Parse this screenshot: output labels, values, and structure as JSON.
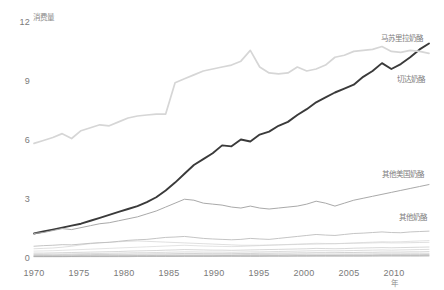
{
  "chart_data": {
    "type": "line",
    "title": "",
    "xlabel": "年",
    "ylabel": "消费量",
    "xlim": [
      1970,
      2012
    ],
    "ylim": [
      0,
      12
    ],
    "grid": false,
    "legend_position": "right-inline-labels",
    "xticks": [
      "1970",
      "1975",
      "1980",
      "1985",
      "1990",
      "1995",
      "2000",
      "2005",
      "2010"
    ],
    "xtick_values": [
      1970,
      1975,
      1980,
      1985,
      1990,
      1995,
      2000,
      2005,
      2010
    ],
    "yticks": [
      "0",
      "3",
      "6",
      "9",
      "12"
    ],
    "ytick_values": [
      0,
      3,
      6,
      9,
      12
    ],
    "x": [
      1970,
      1971,
      1972,
      1973,
      1974,
      1975,
      1976,
      1977,
      1978,
      1979,
      1980,
      1981,
      1982,
      1983,
      1984,
      1985,
      1986,
      1987,
      1988,
      1989,
      1990,
      1991,
      1992,
      1993,
      1994,
      1995,
      1996,
      1997,
      1998,
      1999,
      2000,
      2001,
      2002,
      2003,
      2004,
      2005,
      2006,
      2007,
      2008,
      2009,
      2010,
      2011,
      2012
    ],
    "series": [
      {
        "name": "马苏里拉奶酪",
        "color": "#3a3a3a",
        "width": 1.9,
        "values": [
          1.2,
          1.3,
          1.4,
          1.5,
          1.6,
          1.7,
          1.85,
          2.0,
          2.15,
          2.3,
          2.45,
          2.6,
          2.8,
          3.05,
          3.4,
          3.8,
          4.25,
          4.7,
          5.0,
          5.3,
          5.7,
          5.65,
          6.0,
          5.9,
          6.25,
          6.4,
          6.7,
          6.9,
          7.25,
          7.55,
          7.9,
          8.15,
          8.4,
          8.6,
          8.8,
          9.2,
          9.5,
          9.9,
          9.6,
          9.85,
          10.2,
          10.6,
          10.9
        ]
      },
      {
        "name": "切达奶酪",
        "color": "#d6d6d6",
        "width": 1.7,
        "values": [
          5.8,
          5.95,
          6.1,
          6.3,
          6.05,
          6.45,
          6.6,
          6.75,
          6.7,
          6.9,
          7.1,
          7.2,
          7.25,
          7.3,
          7.3,
          8.9,
          9.1,
          9.3,
          9.5,
          9.6,
          9.7,
          9.8,
          10.0,
          10.55,
          9.7,
          9.4,
          9.35,
          9.4,
          9.7,
          9.5,
          9.6,
          9.8,
          10.2,
          10.3,
          10.5,
          10.55,
          10.6,
          10.75,
          10.5,
          10.45,
          10.55,
          10.5,
          10.4
        ]
      },
      {
        "name": "其他美国奶酪",
        "color": "#a9a9a9",
        "width": 1.0,
        "values": [
          1.2,
          1.25,
          1.35,
          1.45,
          1.4,
          1.5,
          1.6,
          1.7,
          1.75,
          1.85,
          1.95,
          2.05,
          2.2,
          2.35,
          2.55,
          2.75,
          2.95,
          2.9,
          2.75,
          2.7,
          2.65,
          2.55,
          2.5,
          2.6,
          2.5,
          2.45,
          2.5,
          2.55,
          2.6,
          2.7,
          2.85,
          2.75,
          2.6,
          2.75,
          2.9,
          3.0,
          3.1,
          3.2,
          3.3,
          3.4,
          3.5,
          3.6,
          3.7
        ]
      },
      {
        "name": "其他奶酪",
        "color": "#bdbdbd",
        "width": 0.9,
        "values": [
          0.55,
          0.58,
          0.6,
          0.63,
          0.62,
          0.66,
          0.7,
          0.73,
          0.75,
          0.8,
          0.85,
          0.88,
          0.9,
          0.95,
          1.0,
          1.02,
          1.05,
          1.0,
          0.95,
          0.92,
          0.9,
          0.88,
          0.9,
          0.95,
          0.92,
          0.9,
          0.95,
          1.0,
          1.05,
          1.1,
          1.15,
          1.12,
          1.1,
          1.15,
          1.2,
          1.22,
          1.25,
          1.28,
          1.25,
          1.24,
          1.28,
          1.3,
          1.32
        ]
      }
    ],
    "background_series": [
      {
        "name": "thin-1",
        "color": "#c9c9c9",
        "width": 0.6,
        "values": [
          0.42,
          0.44,
          0.46,
          0.5,
          0.55,
          0.62,
          0.68,
          0.72,
          0.75,
          0.78,
          0.8,
          0.82,
          0.8,
          0.78,
          0.76,
          0.74,
          0.72,
          0.7,
          0.68,
          0.66,
          0.64,
          0.62,
          0.6,
          0.6,
          0.6,
          0.61,
          0.62,
          0.63,
          0.64,
          0.65,
          0.66,
          0.67,
          0.68,
          0.69,
          0.7,
          0.71,
          0.72,
          0.73,
          0.72,
          0.72,
          0.73,
          0.74,
          0.75
        ]
      },
      {
        "name": "thin-2",
        "color": "#d0d0d0",
        "width": 0.6,
        "values": [
          0.3,
          0.31,
          0.32,
          0.34,
          0.36,
          0.38,
          0.4,
          0.42,
          0.44,
          0.46,
          0.48,
          0.5,
          0.52,
          0.54,
          0.56,
          0.58,
          0.6,
          0.58,
          0.56,
          0.55,
          0.54,
          0.53,
          0.54,
          0.56,
          0.58,
          0.6,
          0.62,
          0.64,
          0.66,
          0.68,
          0.7,
          0.69,
          0.68,
          0.7,
          0.72,
          0.74,
          0.76,
          0.78,
          0.77,
          0.78,
          0.8,
          0.82,
          0.84
        ]
      },
      {
        "name": "thin-3",
        "color": "#bcbcbc",
        "width": 0.6,
        "values": [
          0.2,
          0.2,
          0.21,
          0.22,
          0.23,
          0.24,
          0.25,
          0.26,
          0.27,
          0.28,
          0.3,
          0.31,
          0.32,
          0.33,
          0.35,
          0.36,
          0.38,
          0.37,
          0.36,
          0.35,
          0.35,
          0.34,
          0.35,
          0.36,
          0.37,
          0.38,
          0.39,
          0.4,
          0.41,
          0.42,
          0.44,
          0.43,
          0.42,
          0.43,
          0.45,
          0.46,
          0.47,
          0.48,
          0.47,
          0.48,
          0.49,
          0.5,
          0.51
        ]
      },
      {
        "name": "thin-4",
        "color": "#c4c4c4",
        "width": 0.6,
        "values": [
          0.14,
          0.14,
          0.15,
          0.15,
          0.16,
          0.17,
          0.18,
          0.18,
          0.19,
          0.2,
          0.21,
          0.22,
          0.22,
          0.23,
          0.24,
          0.25,
          0.26,
          0.26,
          0.25,
          0.25,
          0.25,
          0.24,
          0.25,
          0.26,
          0.26,
          0.27,
          0.28,
          0.29,
          0.3,
          0.31,
          0.32,
          0.32,
          0.31,
          0.32,
          0.33,
          0.34,
          0.35,
          0.36,
          0.35,
          0.36,
          0.37,
          0.38,
          0.39
        ]
      },
      {
        "name": "thin-5",
        "color": "#b5b5b5",
        "width": 0.6,
        "values": [
          0.1,
          0.1,
          0.1,
          0.11,
          0.11,
          0.12,
          0.12,
          0.13,
          0.13,
          0.14,
          0.14,
          0.15,
          0.15,
          0.16,
          0.16,
          0.17,
          0.18,
          0.18,
          0.17,
          0.17,
          0.17,
          0.17,
          0.18,
          0.18,
          0.19,
          0.19,
          0.2,
          0.2,
          0.21,
          0.21,
          0.22,
          0.22,
          0.22,
          0.23,
          0.23,
          0.24,
          0.24,
          0.25,
          0.25,
          0.25,
          0.26,
          0.26,
          0.27
        ]
      },
      {
        "name": "thin-6",
        "color": "#cccccc",
        "width": 0.6,
        "values": [
          0.07,
          0.07,
          0.07,
          0.08,
          0.08,
          0.08,
          0.09,
          0.09,
          0.09,
          0.1,
          0.1,
          0.1,
          0.11,
          0.11,
          0.11,
          0.12,
          0.12,
          0.12,
          0.12,
          0.12,
          0.12,
          0.12,
          0.12,
          0.13,
          0.13,
          0.13,
          0.14,
          0.14,
          0.14,
          0.15,
          0.15,
          0.15,
          0.15,
          0.16,
          0.16,
          0.16,
          0.17,
          0.17,
          0.17,
          0.17,
          0.18,
          0.18,
          0.18
        ]
      },
      {
        "name": "thin-7",
        "color": "#b0b0b0",
        "width": 0.6,
        "values": [
          0.05,
          0.05,
          0.05,
          0.05,
          0.05,
          0.06,
          0.06,
          0.06,
          0.06,
          0.07,
          0.07,
          0.07,
          0.07,
          0.08,
          0.08,
          0.08,
          0.08,
          0.08,
          0.08,
          0.08,
          0.08,
          0.08,
          0.09,
          0.09,
          0.09,
          0.09,
          0.09,
          0.1,
          0.1,
          0.1,
          0.1,
          0.1,
          0.1,
          0.11,
          0.11,
          0.11,
          0.11,
          0.12,
          0.12,
          0.12,
          0.12,
          0.12,
          0.13
        ]
      },
      {
        "name": "thin-8",
        "color": "#a8a8a8",
        "width": 0.6,
        "values": [
          0.03,
          0.03,
          0.03,
          0.03,
          0.03,
          0.04,
          0.04,
          0.04,
          0.04,
          0.04,
          0.04,
          0.05,
          0.05,
          0.05,
          0.05,
          0.05,
          0.05,
          0.05,
          0.05,
          0.05,
          0.06,
          0.06,
          0.06,
          0.06,
          0.06,
          0.06,
          0.06,
          0.06,
          0.07,
          0.07,
          0.07,
          0.07,
          0.07,
          0.07,
          0.07,
          0.07,
          0.08,
          0.08,
          0.08,
          0.08,
          0.08,
          0.08,
          0.08
        ]
      },
      {
        "name": "thin-9",
        "color": "#9e9e9e",
        "width": 0.6,
        "values": [
          0.015,
          0.015,
          0.015,
          0.015,
          0.02,
          0.02,
          0.02,
          0.02,
          0.02,
          0.02,
          0.02,
          0.025,
          0.025,
          0.025,
          0.025,
          0.025,
          0.03,
          0.03,
          0.03,
          0.03,
          0.03,
          0.03,
          0.03,
          0.03,
          0.03,
          0.035,
          0.035,
          0.035,
          0.035,
          0.035,
          0.04,
          0.04,
          0.04,
          0.04,
          0.04,
          0.04,
          0.04,
          0.045,
          0.045,
          0.045,
          0.045,
          0.045,
          0.05
        ]
      }
    ],
    "series_labels": [
      {
        "text": "马苏里拉奶酪",
        "x": 381,
        "y": 35
      },
      {
        "text": "切达奶酪",
        "x": 397,
        "y": 76
      },
      {
        "text": "其他美国奶酪",
        "x": 382,
        "y": 171
      },
      {
        "text": "其他奶酪",
        "x": 399,
        "y": 214
      }
    ]
  }
}
